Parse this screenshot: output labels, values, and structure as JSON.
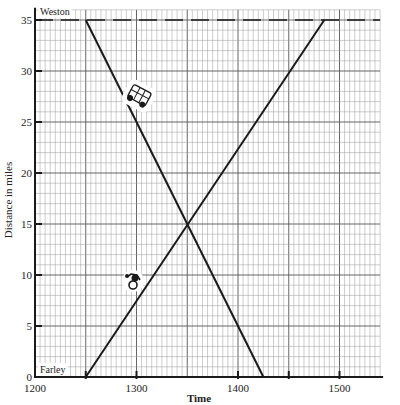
{
  "chart_data": {
    "type": "line",
    "title": "",
    "xlabel": "Time",
    "ylabel": "Distance in miles",
    "xlim": [
      1200,
      1540
    ],
    "ylim": [
      0,
      36
    ],
    "x_ticks": [
      1200,
      1300,
      1400,
      1500
    ],
    "x_tick_labels": [
      "1200",
      "1300",
      "1400",
      "1500"
    ],
    "x_minor_marked_ticks": [
      1250,
      1450
    ],
    "y_ticks": [
      0,
      5,
      10,
      15,
      20,
      25,
      30,
      35
    ],
    "y_tick_labels": [
      "0",
      "5",
      "10",
      "15",
      "20",
      "25",
      "30",
      "35"
    ],
    "grid": true,
    "grid_style": "graph paper, fine grid with 1 mile / 10 time-unit spacing",
    "annotations": [
      {
        "text": "Weston",
        "x": 1200,
        "y": 35,
        "position": "top-left"
      },
      {
        "text": "Farley",
        "x": 1200,
        "y": 0,
        "position": "bottom-left"
      }
    ],
    "reference_lines": [
      {
        "name": "Weston level",
        "y": 35,
        "style": "dashed"
      }
    ],
    "series": [
      {
        "name": "Car (Weston to Farley)",
        "icon": "car-icon",
        "points": [
          [
            1250,
            35
          ],
          [
            1425,
            0
          ]
        ]
      },
      {
        "name": "Bicycle (Farley to Weston)",
        "icon": "bicycle-icon",
        "points": [
          [
            1250,
            0
          ],
          [
            1485,
            35
          ]
        ]
      }
    ],
    "intersection": {
      "x": 1350,
      "y": 15
    }
  },
  "labels": {
    "xlabel": "Time",
    "ylabel": "Distance in miles",
    "weston": "Weston",
    "farley": "Farley"
  },
  "colors": {
    "ink": "#1a1a1a",
    "grid_major": "#555555",
    "grid_minor": "#9a9a9a",
    "paper": "#ffffff"
  }
}
